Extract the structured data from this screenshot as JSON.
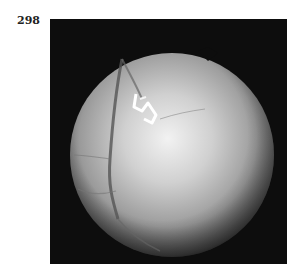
{
  "figure": {
    "label": "298",
    "image": {
      "description": "Grayscale retinal fundus photograph",
      "background_color": "#0d0d0d",
      "fundus_color": "#bdbdbd"
    }
  }
}
